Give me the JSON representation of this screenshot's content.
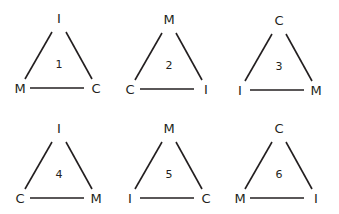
{
  "diagram": {
    "triangles": [
      {
        "number": "1",
        "top": "I",
        "left": "M",
        "right": "C"
      },
      {
        "number": "2",
        "top": "M",
        "left": "C",
        "right": "I"
      },
      {
        "number": "3",
        "top": "C",
        "left": "I",
        "right": "M"
      },
      {
        "number": "4",
        "top": "I",
        "left": "C",
        "right": "M"
      },
      {
        "number": "5",
        "top": "M",
        "left": "I",
        "right": "C"
      },
      {
        "number": "6",
        "top": "C",
        "left": "M",
        "right": "I"
      }
    ]
  }
}
